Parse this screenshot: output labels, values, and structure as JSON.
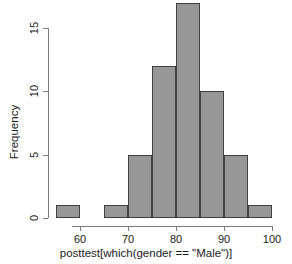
{
  "chart_data": {
    "type": "bar",
    "subtype": "histogram",
    "title": "",
    "xlabel": "posttest[which(gender == \"Male\")]",
    "ylabel": "Frequency",
    "xlim": [
      55,
      100
    ],
    "ylim": [
      0,
      17
    ],
    "xticks": [
      60,
      70,
      80,
      90,
      100
    ],
    "yticks": [
      0,
      5,
      10,
      15
    ],
    "xtick_labels": [
      "60",
      "70",
      "80",
      "90",
      "100"
    ],
    "ytick_labels": [
      "0",
      "5",
      "10",
      "15"
    ],
    "grid": false,
    "legend": null,
    "bin_width": 5,
    "bin_edges": [
      55,
      60,
      65,
      70,
      75,
      80,
      85,
      90,
      95,
      100
    ],
    "categories": [
      "55-60",
      "60-65",
      "65-70",
      "70-75",
      "75-80",
      "80-85",
      "85-90",
      "90-95",
      "95-100"
    ],
    "values": [
      1,
      0,
      1,
      5,
      12,
      17,
      10,
      5,
      1
    ],
    "bars": [
      {
        "bin_start": 55,
        "bin_end": 60,
        "count": 1
      },
      {
        "bin_start": 60,
        "bin_end": 65,
        "count": 0
      },
      {
        "bin_start": 65,
        "bin_end": 70,
        "count": 1
      },
      {
        "bin_start": 70,
        "bin_end": 75,
        "count": 5
      },
      {
        "bin_start": 75,
        "bin_end": 80,
        "count": 12
      },
      {
        "bin_start": 80,
        "bin_end": 85,
        "count": 17
      },
      {
        "bin_start": 85,
        "bin_end": 90,
        "count": 10
      },
      {
        "bin_start": 90,
        "bin_end": 95,
        "count": 5
      },
      {
        "bin_start": 95,
        "bin_end": 100,
        "count": 1
      }
    ],
    "colors": {
      "bar_fill": "#979797",
      "bar_border": "#404040",
      "axis": "#7c7c7c",
      "text": "#1a1a1a",
      "background": "#ffffff"
    }
  },
  "geometry": {
    "x_pixel_at_60": 80,
    "x_pixels_per_unit": 4.8,
    "y_pixel_at_0": 218,
    "y_pixels_per_unit": 12.666,
    "x_axis_left": 72,
    "x_axis_right": 272,
    "y_axis_x": 48,
    "y_axis_top": 28
  }
}
